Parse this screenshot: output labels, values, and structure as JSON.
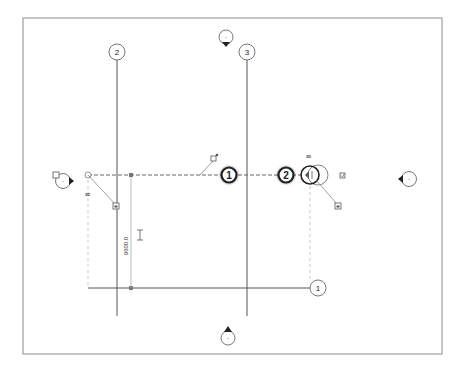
{
  "view": {
    "type": "floor-plan",
    "background": "#ffffff",
    "frame_color": "#8a8a8a",
    "line_color": "#555555"
  },
  "grids": {
    "vertical": [
      {
        "label": "2"
      },
      {
        "label": "3"
      }
    ],
    "horizontal": [
      {
        "label": "1"
      }
    ],
    "selected": {
      "labels": [
        "1",
        "2"
      ],
      "tag_3d": "3D"
    }
  },
  "elevation_markers": {
    "top": {
      "label": "-"
    },
    "bottom": {
      "label": "-"
    },
    "left": {
      "label": "-"
    },
    "right": {
      "label": "-"
    }
  },
  "dimension": {
    "value": "9600.0"
  },
  "tags": {
    "left_3d": "3D",
    "right_3d": "3D"
  }
}
